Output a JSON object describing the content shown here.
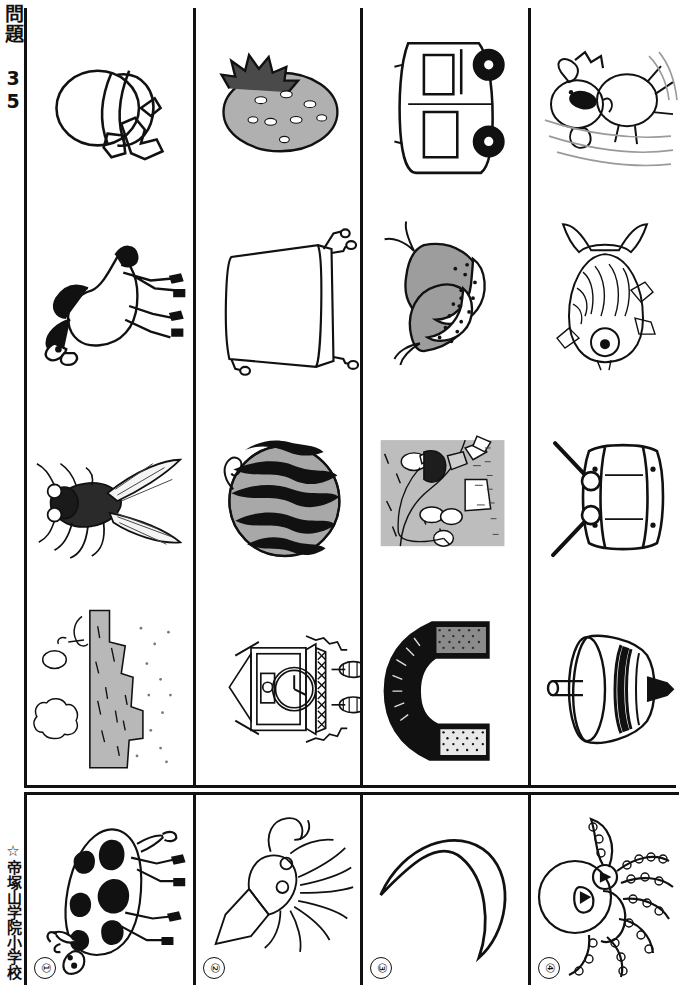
{
  "sheet": {
    "title": "問題 35",
    "school": "☆帝塚山学院小学校",
    "orientation": "rotated-90"
  },
  "grid": {
    "columns": 4,
    "rows": 4,
    "cells": [
      {
        "row": 1,
        "col": 1,
        "name": "hat-with-ribbon",
        "label": "ぼうし"
      },
      {
        "row": 1,
        "col": 2,
        "name": "strawberry",
        "label": "いちご"
      },
      {
        "row": 1,
        "col": 3,
        "name": "car",
        "label": "じどうしゃ"
      },
      {
        "row": 1,
        "col": 4,
        "name": "running-dog",
        "label": "いぬ"
      },
      {
        "row": 2,
        "col": 1,
        "name": "horse",
        "label": "うま"
      },
      {
        "row": 2,
        "col": 2,
        "name": "desk",
        "label": "つくえ"
      },
      {
        "row": 2,
        "col": 3,
        "name": "cherries",
        "label": "さくらんぼ"
      },
      {
        "row": 2,
        "col": 4,
        "name": "fish",
        "label": "さかな"
      },
      {
        "row": 3,
        "col": 1,
        "name": "cicada",
        "label": "せみ"
      },
      {
        "row": 3,
        "col": 2,
        "name": "watermelon",
        "label": "すいか"
      },
      {
        "row": 3,
        "col": 3,
        "name": "fishing-scene",
        "label": "つり"
      },
      {
        "row": 3,
        "col": 4,
        "name": "drum",
        "label": "たいこ"
      },
      {
        "row": 4,
        "col": 1,
        "name": "mountain-cliff",
        "label": "やま"
      },
      {
        "row": 4,
        "col": 2,
        "name": "cuckoo-clock",
        "label": "とけい"
      },
      {
        "row": 4,
        "col": 3,
        "name": "horseshoe-magnet",
        "label": "じしゃく"
      },
      {
        "row": 4,
        "col": 4,
        "name": "spinning-top",
        "label": "こま"
      }
    ]
  },
  "answer_row": {
    "items": [
      {
        "number": "①",
        "name": "cow",
        "label": "うし"
      },
      {
        "number": "②",
        "name": "squid",
        "label": "いか"
      },
      {
        "number": "③",
        "name": "crescent-moon",
        "label": "つき"
      },
      {
        "number": "④",
        "name": "octopus",
        "label": "たこ"
      }
    ]
  },
  "colors": {
    "ink": "#111111",
    "paper": "#ffffff",
    "midtone": "#9a9a9a",
    "lighttone": "#c9c9c9"
  }
}
